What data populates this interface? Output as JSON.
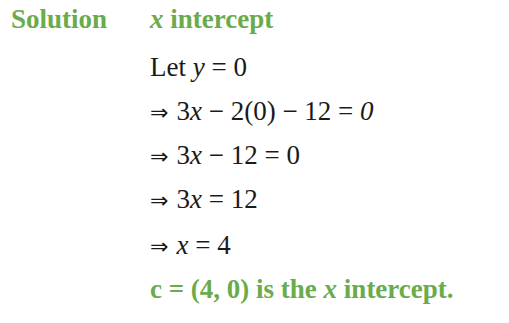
{
  "heading": {
    "label": "Solution",
    "topic_var": "x",
    "topic_text": " intercept"
  },
  "steps": [
    {
      "prefix": "Let ",
      "var": "y",
      "rest": " = 0"
    },
    {
      "arrow": "⇒",
      "lhs_num": "3",
      "lhs_var": "x",
      "rest": " − 2(0) − 12 = ",
      "rhs": "0"
    },
    {
      "arrow": "⇒",
      "lhs_num": "3",
      "lhs_var": "x",
      "rest": " − 12 = 0"
    },
    {
      "arrow": "⇒",
      "lhs_num": "3",
      "lhs_var": "x",
      "rest": " = 12"
    },
    {
      "arrow": "⇒",
      "lhs_var": "x",
      "rest": " = 4"
    }
  ],
  "conclusion": {
    "prefix": "c = (4, 0) is the ",
    "var": "x",
    "suffix": " intercept."
  },
  "colors": {
    "accent_green": "#6aab4c",
    "text": "#1a1a1a"
  }
}
